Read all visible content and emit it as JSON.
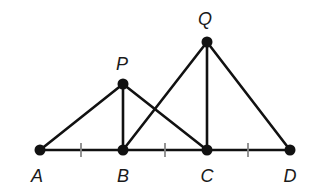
{
  "diagram": {
    "type": "geometry-figure",
    "stroke_color": "#111111",
    "tick_color": "#888888",
    "points": [
      {
        "id": "A",
        "label": "A",
        "x": 40,
        "y": 150,
        "label_x": 37,
        "label_y": 182
      },
      {
        "id": "B",
        "label": "B",
        "x": 123,
        "y": 150,
        "label_x": 123,
        "label_y": 182
      },
      {
        "id": "C",
        "label": "C",
        "x": 207,
        "y": 150,
        "label_x": 207,
        "label_y": 182
      },
      {
        "id": "D",
        "label": "D",
        "x": 290,
        "y": 150,
        "label_x": 290,
        "label_y": 182
      },
      {
        "id": "P",
        "label": "P",
        "x": 123,
        "y": 84,
        "label_x": 122,
        "label_y": 70
      },
      {
        "id": "Q",
        "label": "Q",
        "x": 207,
        "y": 42,
        "label_x": 205,
        "label_y": 25
      }
    ],
    "segments": [
      [
        "A",
        "D"
      ],
      [
        "A",
        "P"
      ],
      [
        "P",
        "B"
      ],
      [
        "P",
        "C"
      ],
      [
        "B",
        "Q"
      ],
      [
        "Q",
        "C"
      ],
      [
        "Q",
        "D"
      ]
    ],
    "congruence_ticks": [
      {
        "between": [
          "A",
          "B"
        ],
        "x": 81
      },
      {
        "between": [
          "B",
          "C"
        ],
        "x": 165
      },
      {
        "between": [
          "C",
          "D"
        ],
        "x": 248
      }
    ]
  }
}
